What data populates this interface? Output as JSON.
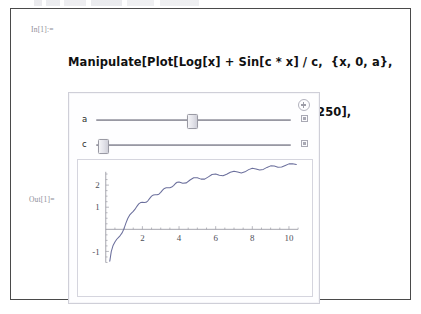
{
  "notebook": {
    "in_label": "In[1]:=",
    "out_label": "Out[1]=",
    "code_lines": [
      "Manipulate[Plot[Log[x] + Sin[c * x] / c,  {x, 0, a},",
      "AxesOrigin → {0, 0}, PlotPoints → 250],",
      "{a, .1, 20}, {c, 1, 100}]"
    ]
  },
  "manipulate": {
    "expand_icon": "plus-circle-icon",
    "controls": [
      {
        "label": "a",
        "min": 0.1,
        "max": 20,
        "value": 10.5,
        "handle_percent": 49,
        "animate_icon": "animate-square-icon"
      },
      {
        "label": "c",
        "min": 1,
        "max": 100,
        "value": 5,
        "handle_percent": 1,
        "animate_icon": "animate-square-icon"
      }
    ]
  },
  "chart_data": {
    "type": "line",
    "title": "",
    "xlabel": "",
    "ylabel": "",
    "expression": "Log[x] + Sin[c*x]/c",
    "grid": false,
    "legend": null,
    "axes_origin": [
      0,
      0
    ],
    "xlim": [
      0,
      10.5
    ],
    "ylim": [
      -1.5,
      2.6
    ],
    "xticks": [
      2,
      4,
      6,
      8,
      10
    ],
    "yticks": [
      -1,
      1,
      2
    ],
    "xtick_labels": [
      "2",
      "4",
      "6",
      "8",
      "10"
    ],
    "ytick_labels": [
      "-1",
      "1",
      "2"
    ],
    "line_color": "#6b6f9c",
    "series": [
      {
        "name": "Log[x]+Sin[5x]/5",
        "x": [
          0.22,
          0.3,
          0.4,
          0.5,
          0.6,
          0.7,
          0.8,
          0.9,
          1.0,
          1.1,
          1.2,
          1.3,
          1.4,
          1.5,
          1.6,
          1.7,
          1.8,
          1.9,
          2.0,
          2.1,
          2.2,
          2.3,
          2.4,
          2.5,
          2.6,
          2.7,
          2.8,
          2.9,
          3.0,
          3.1,
          3.2,
          3.3,
          3.4,
          3.5,
          3.6,
          3.7,
          3.8,
          3.9,
          4.0,
          4.2,
          4.4,
          4.6,
          4.8,
          5.0,
          5.2,
          5.4,
          5.6,
          5.8,
          6.0,
          6.2,
          6.4,
          6.6,
          6.8,
          7.0,
          7.2,
          7.4,
          7.6,
          7.8,
          8.0,
          8.2,
          8.4,
          8.6,
          8.8,
          9.0,
          9.2,
          9.4,
          9.6,
          9.8,
          10.0,
          10.2,
          10.4
        ],
        "y": [
          -1.44,
          -1.01,
          -0.73,
          -0.57,
          -0.45,
          -0.36,
          -0.27,
          -0.15,
          0.04,
          0.28,
          0.49,
          0.64,
          0.73,
          0.81,
          0.91,
          1.04,
          1.15,
          1.21,
          1.22,
          1.21,
          1.22,
          1.29,
          1.4,
          1.5,
          1.55,
          1.56,
          1.56,
          1.59,
          1.67,
          1.77,
          1.85,
          1.88,
          1.88,
          1.88,
          1.91,
          1.98,
          2.07,
          2.13,
          2.14,
          2.08,
          2.1,
          2.23,
          2.33,
          2.33,
          2.27,
          2.27,
          2.37,
          2.48,
          2.5,
          2.45,
          2.42,
          2.49,
          2.58,
          2.63,
          2.59,
          2.55,
          2.6,
          2.7,
          2.76,
          2.73,
          2.68,
          2.71,
          2.8,
          2.87,
          2.86,
          2.81,
          2.82,
          2.89,
          2.96,
          2.97,
          2.93
        ]
      }
    ]
  }
}
